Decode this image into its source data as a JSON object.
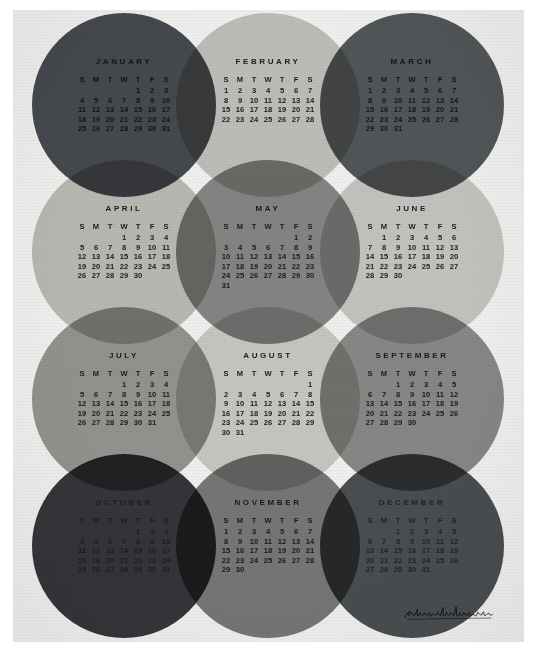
{
  "poster": {
    "title": "2015 Circles Calendar",
    "signature": "superkonduktor",
    "background_color": "#eeeeec",
    "border_color": "#ffffff"
  },
  "weekday_headers": [
    "S",
    "M",
    "T",
    "W",
    "T",
    "F",
    "S"
  ],
  "palette": {
    "january": "#4a4d52",
    "february": "#c9cac6",
    "march": "#585b5f",
    "april": "#c2c4c0",
    "may": "#8b8d8c",
    "june": "#cfd0cc",
    "july": "#9a9c9a",
    "august": "#d2d3cf",
    "september": "#8f9190",
    "october": "#36383c",
    "november": "#7c7e7e",
    "december": "#4f5256"
  },
  "months": [
    {
      "name": "JANUARY",
      "index": 1,
      "start_weekday": 4,
      "days": 31,
      "weeks": [
        [
          "",
          "",
          "",
          "",
          "1",
          "2",
          "3"
        ],
        [
          "4",
          "5",
          "6",
          "7",
          "8",
          "9",
          "10"
        ],
        [
          "11",
          "12",
          "13",
          "14",
          "15",
          "16",
          "17"
        ],
        [
          "18",
          "19",
          "20",
          "21",
          "22",
          "23",
          "24"
        ],
        [
          "25",
          "26",
          "27",
          "28",
          "29",
          "30",
          "31"
        ]
      ]
    },
    {
      "name": "FEBRUARY",
      "index": 2,
      "start_weekday": 0,
      "days": 28,
      "weeks": [
        [
          "1",
          "2",
          "3",
          "4",
          "5",
          "6",
          "7"
        ],
        [
          "8",
          "9",
          "10",
          "11",
          "12",
          "13",
          "14"
        ],
        [
          "15",
          "16",
          "17",
          "18",
          "19",
          "20",
          "21"
        ],
        [
          "22",
          "23",
          "24",
          "25",
          "26",
          "27",
          "28"
        ]
      ]
    },
    {
      "name": "MARCH",
      "index": 3,
      "start_weekday": 0,
      "days": 31,
      "weeks": [
        [
          "1",
          "2",
          "3",
          "4",
          "5",
          "6",
          "7"
        ],
        [
          "8",
          "9",
          "10",
          "11",
          "12",
          "13",
          "14"
        ],
        [
          "15",
          "16",
          "17",
          "18",
          "19",
          "20",
          "21"
        ],
        [
          "22",
          "23",
          "24",
          "25",
          "26",
          "27",
          "28"
        ],
        [
          "29",
          "30",
          "31",
          "",
          "",
          "",
          ""
        ]
      ]
    },
    {
      "name": "APRIL",
      "index": 4,
      "start_weekday": 3,
      "days": 30,
      "weeks": [
        [
          "",
          "",
          "",
          "1",
          "2",
          "3",
          "4"
        ],
        [
          "5",
          "6",
          "7",
          "8",
          "9",
          "10",
          "11"
        ],
        [
          "12",
          "13",
          "14",
          "15",
          "16",
          "17",
          "18"
        ],
        [
          "19",
          "20",
          "21",
          "22",
          "23",
          "24",
          "25"
        ],
        [
          "26",
          "27",
          "28",
          "29",
          "30",
          "",
          ""
        ]
      ]
    },
    {
      "name": "MAY",
      "index": 5,
      "start_weekday": 5,
      "days": 31,
      "weeks": [
        [
          "",
          "",
          "",
          "",
          "",
          "1",
          "2"
        ],
        [
          "3",
          "4",
          "5",
          "6",
          "7",
          "8",
          "9"
        ],
        [
          "10",
          "11",
          "12",
          "13",
          "14",
          "15",
          "16"
        ],
        [
          "17",
          "18",
          "19",
          "20",
          "21",
          "22",
          "23"
        ],
        [
          "24",
          "25",
          "26",
          "27",
          "28",
          "29",
          "30"
        ],
        [
          "31",
          "",
          "",
          "",
          "",
          "",
          ""
        ]
      ]
    },
    {
      "name": "JUNE",
      "index": 6,
      "start_weekday": 1,
      "days": 30,
      "weeks": [
        [
          "",
          "1",
          "2",
          "3",
          "4",
          "5",
          "6"
        ],
        [
          "7",
          "8",
          "9",
          "10",
          "11",
          "12",
          "13"
        ],
        [
          "14",
          "15",
          "16",
          "17",
          "18",
          "19",
          "20"
        ],
        [
          "21",
          "22",
          "23",
          "24",
          "25",
          "26",
          "27"
        ],
        [
          "28",
          "29",
          "30",
          "",
          "",
          "",
          ""
        ]
      ]
    },
    {
      "name": "JULY",
      "index": 7,
      "start_weekday": 3,
      "days": 31,
      "weeks": [
        [
          "",
          "",
          "",
          "1",
          "2",
          "3",
          "4"
        ],
        [
          "5",
          "6",
          "7",
          "8",
          "9",
          "10",
          "11"
        ],
        [
          "12",
          "13",
          "14",
          "15",
          "16",
          "17",
          "18"
        ],
        [
          "19",
          "20",
          "21",
          "22",
          "23",
          "24",
          "25"
        ],
        [
          "26",
          "27",
          "28",
          "29",
          "30",
          "31",
          ""
        ]
      ]
    },
    {
      "name": "AUGUST",
      "index": 8,
      "start_weekday": 6,
      "days": 31,
      "weeks": [
        [
          "",
          "",
          "",
          "",
          "",
          "",
          "1"
        ],
        [
          "2",
          "3",
          "4",
          "5",
          "6",
          "7",
          "8"
        ],
        [
          "9",
          "10",
          "11",
          "12",
          "13",
          "14",
          "15"
        ],
        [
          "16",
          "17",
          "18",
          "19",
          "20",
          "21",
          "22"
        ],
        [
          "23",
          "24",
          "25",
          "26",
          "27",
          "28",
          "29"
        ],
        [
          "30",
          "31",
          "",
          "",
          "",
          "",
          ""
        ]
      ]
    },
    {
      "name": "SEPTEMBER",
      "index": 9,
      "start_weekday": 2,
      "days": 30,
      "weeks": [
        [
          "",
          "",
          "1",
          "2",
          "3",
          "4",
          "5"
        ],
        [
          "6",
          "7",
          "8",
          "9",
          "10",
          "11",
          "12"
        ],
        [
          "13",
          "14",
          "15",
          "16",
          "17",
          "18",
          "19"
        ],
        [
          "20",
          "21",
          "22",
          "23",
          "24",
          "25",
          "26"
        ],
        [
          "27",
          "28",
          "29",
          "30",
          "",
          "",
          ""
        ]
      ]
    },
    {
      "name": "OCTOBER",
      "index": 10,
      "start_weekday": 4,
      "days": 31,
      "weeks": [
        [
          "",
          "",
          "",
          "",
          "1",
          "2",
          "3"
        ],
        [
          "4",
          "5",
          "6",
          "7",
          "8",
          "9",
          "10"
        ],
        [
          "11",
          "12",
          "13",
          "14",
          "15",
          "16",
          "17"
        ],
        [
          "18",
          "19",
          "20",
          "21",
          "22",
          "23",
          "24"
        ],
        [
          "25",
          "26",
          "27",
          "28",
          "29",
          "30",
          "31"
        ]
      ]
    },
    {
      "name": "NOVEMBER",
      "index": 11,
      "start_weekday": 0,
      "days": 30,
      "weeks": [
        [
          "1",
          "2",
          "3",
          "4",
          "5",
          "6",
          "7"
        ],
        [
          "8",
          "9",
          "10",
          "11",
          "12",
          "13",
          "14"
        ],
        [
          "15",
          "16",
          "17",
          "18",
          "19",
          "20",
          "21"
        ],
        [
          "22",
          "23",
          "24",
          "25",
          "26",
          "27",
          "28"
        ],
        [
          "29",
          "30",
          "",
          "",
          "",
          "",
          ""
        ]
      ]
    },
    {
      "name": "DECEMBER",
      "index": 12,
      "start_weekday": 2,
      "days": 31,
      "weeks": [
        [
          "",
          "",
          "1",
          "2",
          "3",
          "4",
          "5"
        ],
        [
          "6",
          "7",
          "8",
          "9",
          "10",
          "11",
          "12"
        ],
        [
          "13",
          "14",
          "15",
          "16",
          "17",
          "18",
          "19"
        ],
        [
          "20",
          "21",
          "22",
          "23",
          "24",
          "25",
          "26"
        ],
        [
          "27",
          "28",
          "29",
          "30",
          "31",
          "",
          ""
        ]
      ]
    }
  ],
  "layout": {
    "circle_positions": [
      {
        "cx": 111,
        "cy": 95,
        "r": 92,
        "color": "#4a4d52",
        "tone": "tone-dark"
      },
      {
        "cx": 255,
        "cy": 95,
        "r": 92,
        "color": "#c9cac6",
        "tone": "tone-mid"
      },
      {
        "cx": 399,
        "cy": 95,
        "r": 92,
        "color": "#585b5f",
        "tone": "tone-dark"
      },
      {
        "cx": 111,
        "cy": 242,
        "r": 92,
        "color": "#c2c4c0",
        "tone": "tone-mid"
      },
      {
        "cx": 255,
        "cy": 242,
        "r": 92,
        "color": "#8b8d8c",
        "tone": "tone-mid"
      },
      {
        "cx": 399,
        "cy": 242,
        "r": 92,
        "color": "#cfd0cc",
        "tone": "tone-mid"
      },
      {
        "cx": 111,
        "cy": 389,
        "r": 92,
        "color": "#9a9c9a",
        "tone": "tone-mid"
      },
      {
        "cx": 255,
        "cy": 389,
        "r": 92,
        "color": "#d2d3cf",
        "tone": "tone-mid"
      },
      {
        "cx": 399,
        "cy": 389,
        "r": 92,
        "color": "#8f9190",
        "tone": "tone-mid"
      },
      {
        "cx": 111,
        "cy": 536,
        "r": 92,
        "color": "#36383c",
        "tone": "tone-deep"
      },
      {
        "cx": 255,
        "cy": 536,
        "r": 92,
        "color": "#7c7e7e",
        "tone": "tone-mid"
      },
      {
        "cx": 399,
        "cy": 536,
        "r": 92,
        "color": "#4f5256",
        "tone": "tone-deep"
      }
    ]
  }
}
